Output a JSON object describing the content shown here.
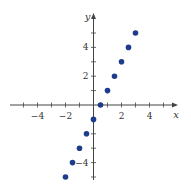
{
  "chart_data": {
    "type": "scatter",
    "title": "",
    "xlabel": "x",
    "ylabel": "y",
    "xlim": [
      -6,
      6
    ],
    "ylim": [
      -5.3,
      6.3
    ],
    "grid": false,
    "legend": null,
    "x_tick_labels": [
      "-4",
      "-2",
      "2",
      "4"
    ],
    "x_tick_values": [
      -4,
      -2,
      2,
      4
    ],
    "x_minor_ticks": [
      -5,
      -4,
      -3,
      -2,
      -1,
      1,
      2,
      3,
      4,
      5
    ],
    "y_tick_labels": [
      "4",
      "2",
      "-4"
    ],
    "y_tick_values": [
      4,
      2,
      -4
    ],
    "y_minor_ticks": [
      -5,
      -4,
      -3,
      -2,
      -1,
      1,
      2,
      3,
      4,
      5
    ],
    "series": [
      {
        "name": "points",
        "color": "#1f3c8c",
        "x": [
          -2,
          -1.5,
          -1,
          -0.5,
          0,
          0.5,
          1,
          1.5,
          2,
          2.5,
          3
        ],
        "y": [
          -5,
          -4,
          -3,
          -2,
          -1,
          0,
          1,
          2,
          3,
          4,
          5
        ]
      }
    ]
  }
}
